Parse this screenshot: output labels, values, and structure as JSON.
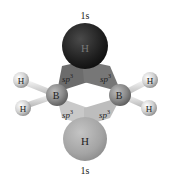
{
  "diagram": {
    "top_orbital_label": "1s",
    "bottom_orbital_label": "1s",
    "bridging_h_top": {
      "label": "H",
      "color": "#262626"
    },
    "bridging_h_bottom": {
      "label": "H",
      "color": "#a6a6a6"
    },
    "boron_left": {
      "label": "B"
    },
    "boron_right": {
      "label": "B"
    },
    "terminal_h": [
      {
        "label": "H"
      },
      {
        "label": "H"
      },
      {
        "label": "H"
      },
      {
        "label": "H"
      }
    ],
    "hybrid_labels": {
      "upper_left": "sp",
      "upper_right": "sp",
      "lower_left": "sp",
      "lower_right": "sp",
      "superscript": "3"
    },
    "colors": {
      "upper_lobe": "#6e6e6e",
      "lower_lobe": "#c8c8c8",
      "boron": "#8a8a8a",
      "terminal_h": "#d4d4d4",
      "bond": "#e6e6e6"
    }
  }
}
